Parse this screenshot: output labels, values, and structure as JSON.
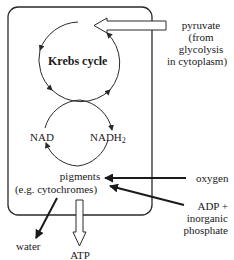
{
  "diagram": {
    "krebs_label": "Krebs cycle",
    "nad_label": "NAD",
    "nadh2_label": "NADH",
    "nadh2_subscript": "2",
    "pigments_line1": "pigments",
    "pigments_line2": "(e.g. cytochromes)",
    "inputs": {
      "pyruvate": [
        "pyruvate",
        "(from",
        "glycolysis",
        "in cytoplasm)"
      ],
      "oxygen": "oxygen",
      "adp": [
        "ADP +",
        "inorganic",
        "phosphate"
      ]
    },
    "outputs": {
      "water": "water",
      "atp": "ATP"
    },
    "colors": {
      "stroke": "#2a2a2a",
      "background": "#ffffff"
    }
  }
}
